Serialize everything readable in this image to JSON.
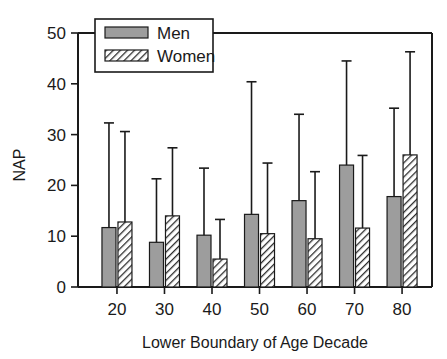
{
  "chart_data": {
    "type": "bar",
    "title": "",
    "xlabel": "Lower Boundary of Age Decade",
    "ylabel": "NAP",
    "categories": [
      "20",
      "30",
      "40",
      "50",
      "60",
      "70",
      "80"
    ],
    "ylim": [
      0,
      50
    ],
    "xlim_note": "categorical, 7 age decades",
    "yticks": [
      0,
      10,
      20,
      30,
      40,
      50
    ],
    "ytick_labels": [
      "0",
      "10",
      "20",
      "30",
      "40",
      "50"
    ],
    "grid": false,
    "legend_position": "top-left-inside",
    "error_bar_style": "upper-only-with-caps",
    "series": [
      {
        "name": "Men",
        "fill": "solid-gray",
        "color": "#9d9d9d",
        "values": [
          11.7,
          8.8,
          10.2,
          14.3,
          17.0,
          24.0,
          17.8
        ],
        "err_upper": [
          32.3,
          21.3,
          23.4,
          40.4,
          34.0,
          44.5,
          35.2
        ]
      },
      {
        "name": "Women",
        "fill": "diagonal-hatch",
        "color": "#ffffff",
        "values": [
          12.8,
          14.0,
          5.5,
          10.5,
          9.5,
          11.6,
          26.0
        ],
        "err_upper": [
          30.6,
          27.4,
          13.3,
          24.4,
          22.7,
          25.9,
          46.3
        ]
      }
    ]
  },
  "legend": {
    "items": [
      {
        "label": "Men"
      },
      {
        "label": "Women"
      }
    ]
  },
  "axes": {
    "y_title": "NAP",
    "x_title": "Lower Boundary of Age Decade"
  }
}
